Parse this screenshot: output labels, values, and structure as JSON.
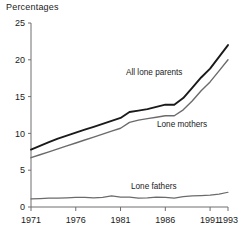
{
  "chart_data": {
    "type": "line",
    "title": "Percentages",
    "xlabel": "",
    "ylabel": "",
    "xlim": [
      1971,
      1993
    ],
    "ylim": [
      0,
      25
    ],
    "yticks": [
      0,
      5,
      10,
      15,
      20,
      25
    ],
    "xticks": [
      1971,
      1976,
      1981,
      1986,
      1991,
      1993
    ],
    "ytick_labels": [
      "0",
      "5",
      "10",
      "15",
      "20",
      "25"
    ],
    "xtick_labels": [
      "1971",
      "1976",
      "1981",
      "1986",
      "1991",
      "1993"
    ],
    "grid": false,
    "legend_position": "inline-annotations",
    "x": [
      1971,
      1972,
      1973,
      1974,
      1975,
      1976,
      1977,
      1978,
      1979,
      1980,
      1981,
      1982,
      1983,
      1984,
      1985,
      1986,
      1987,
      1988,
      1989,
      1990,
      1991,
      1992,
      1993
    ],
    "series": [
      {
        "name": "All lone parents",
        "color": "#1a1a1a",
        "width": 1.9,
        "values": [
          7.8,
          8.3,
          8.8,
          9.3,
          9.7,
          10.1,
          10.5,
          10.9,
          11.3,
          11.7,
          12.1,
          12.9,
          13.1,
          13.3,
          13.6,
          13.9,
          13.9,
          14.8,
          16.2,
          17.6,
          18.8,
          20.4,
          22.0
        ]
      },
      {
        "name": "Lone mothers",
        "color": "#6b6b6b",
        "width": 1.4,
        "values": [
          6.7,
          7.1,
          7.5,
          7.9,
          8.3,
          8.7,
          9.1,
          9.5,
          9.9,
          10.3,
          10.7,
          11.5,
          11.8,
          12.0,
          12.2,
          12.4,
          12.4,
          13.2,
          14.4,
          15.8,
          17.0,
          18.5,
          20.0
        ]
      },
      {
        "name": "Lone fathers",
        "color": "#6b6b6b",
        "width": 1.2,
        "values": [
          1.1,
          1.15,
          1.2,
          1.2,
          1.25,
          1.3,
          1.3,
          1.25,
          1.3,
          1.5,
          1.35,
          1.35,
          1.2,
          1.25,
          1.35,
          1.3,
          1.2,
          1.4,
          1.5,
          1.55,
          1.6,
          1.75,
          2.0
        ]
      }
    ],
    "annotations": [
      {
        "text": "All lone parents",
        "x": 126,
        "y": 75
      },
      {
        "text": "Lone mothers",
        "x": 157,
        "y": 127
      },
      {
        "text": "Lone fathers",
        "x": 131,
        "y": 189
      }
    ]
  }
}
